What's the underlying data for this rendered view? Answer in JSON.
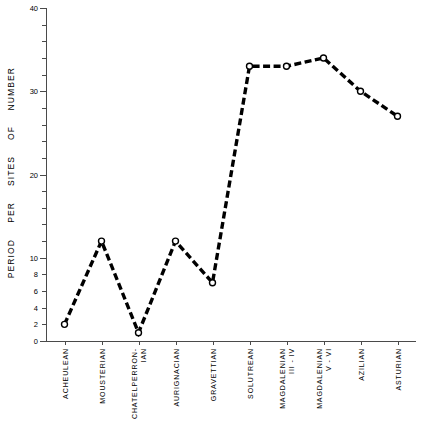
{
  "chart_data": {
    "type": "line",
    "title": "",
    "xlabel": "",
    "ylabel": "NUMBER OF SITES PER PERIOD",
    "ylabel_words": [
      "NUMBER",
      "OF",
      "SITES",
      "PER",
      "PERIOD"
    ],
    "categories": [
      "ACHEULEAN",
      "MOUSTERIAN",
      "CHATELPERRON-IAN",
      "AURIGNACIAN",
      "GRAVETTIAN",
      "SOLUTREAN",
      "MAGDALENIAN III-IV",
      "MAGDALENIAN V-VI",
      "AZILIAN",
      "ASTURIAN"
    ],
    "category_lines": [
      [
        "ACHEULEAN"
      ],
      [
        "MOUSTERIAN"
      ],
      [
        "CHATELPERRON-",
        "IAN"
      ],
      [
        "AURIGNACIAN"
      ],
      [
        "GRAVETTIAN"
      ],
      [
        "SOLUTREAN"
      ],
      [
        "MAGDALENIAN",
        "III - IV"
      ],
      [
        "MAGDALENIAN",
        "V - VI"
      ],
      [
        "AZILIAN"
      ],
      [
        "ASTURIAN"
      ]
    ],
    "values": [
      2,
      12,
      1,
      12,
      7,
      33,
      33,
      34,
      30,
      27
    ],
    "ylim": [
      0,
      40
    ],
    "major_ticks": [
      0,
      10,
      20,
      30,
      40
    ],
    "major_tick_labels": [
      "0",
      "10",
      "20",
      "30",
      "40"
    ],
    "minor_ticks": [
      2,
      4,
      6,
      8,
      12,
      14,
      16,
      18,
      22,
      24,
      26,
      28,
      32,
      34,
      36,
      38
    ],
    "low_minor_labeled": [
      2,
      4,
      6,
      8
    ],
    "low_minor_labels": [
      "2",
      "4",
      "6",
      "8"
    ],
    "grid": false,
    "legend": "none",
    "line_style": "dashed",
    "line_color": "#000000",
    "marker": "open-circle",
    "marker_color": "#000000"
  }
}
